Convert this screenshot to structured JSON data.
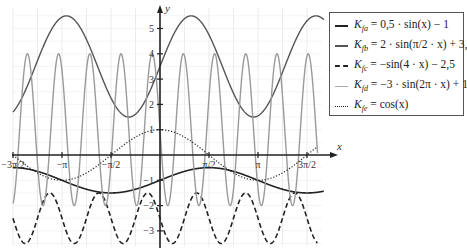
{
  "chart_data": {
    "type": "line",
    "title": "",
    "xlabel": "x",
    "ylabel": "y",
    "xlim": [
      -4.712,
      5.0
    ],
    "ylim": [
      -3.6,
      5.8
    ],
    "grid": true,
    "legend_position": "upper right",
    "x_ticks": [
      {
        "value": -4.712,
        "label": "-3π/2"
      },
      {
        "value": -3.1416,
        "label": "-π"
      },
      {
        "value": -1.5708,
        "label": "-π/2"
      },
      {
        "value": 1.5708,
        "label": "π/2"
      },
      {
        "value": 3.1416,
        "label": "π"
      },
      {
        "value": 4.712,
        "label": "3π/2"
      }
    ],
    "y_ticks": [
      {
        "value": 5,
        "label": "5"
      },
      {
        "value": 4,
        "label": "4"
      },
      {
        "value": 3,
        "label": "3"
      },
      {
        "value": 2,
        "label": "2"
      },
      {
        "value": 1,
        "label": "1"
      },
      {
        "value": -1,
        "label": "-1"
      },
      {
        "value": -2,
        "label": "-2"
      },
      {
        "value": -3,
        "label": "-3"
      }
    ],
    "series": [
      {
        "name": "K_fa = 0,5·sin(x) − 1",
        "id": "fa",
        "amp": 0.5,
        "freq": 1.0,
        "shift": -1.0,
        "style": "solid",
        "color": "#222222",
        "width": 1.6
      },
      {
        "name": "K_fb = 2·sin(π/2·x) + 3,5",
        "id": "fb",
        "amp": 2.0,
        "freq": 1.5708,
        "shift": 3.5,
        "style": "solid",
        "color": "#555555",
        "width": 1.4
      },
      {
        "name": "K_fc = −sin(4·x) − 2,5",
        "id": "fc",
        "amp": -1.0,
        "freq": 4.0,
        "shift": -2.5,
        "style": "dashed",
        "color": "#222222",
        "width": 1.6
      },
      {
        "name": "K_fd = −3·sin(2π·x) + 1",
        "id": "fd",
        "amp": -3.0,
        "freq": 6.2832,
        "shift": 1.0,
        "style": "solid",
        "color": "#9a9a9a",
        "width": 1.4
      },
      {
        "name": "K_fe = cos(x)",
        "id": "fe",
        "amp": 1.0,
        "freq": 1.0,
        "shift": 0.0,
        "phase": 1.5708,
        "style": "dotted",
        "color": "#222222",
        "width": 1.2
      }
    ]
  },
  "legend": {
    "items": [
      {
        "prefix": "K",
        "sub": "fa",
        "formula": " = 0,5 · sin(x) − 1"
      },
      {
        "prefix": "K",
        "sub": "fb",
        "formula": " = 2 · sin(π/2 · x) + 3,5"
      },
      {
        "prefix": "K",
        "sub": "fc",
        "formula": " = −sin(4 · x) − 2,5"
      },
      {
        "prefix": "K",
        "sub": "fd",
        "formula": " = −3 · sin(2π · x) + 1"
      },
      {
        "prefix": "K",
        "sub": "fe",
        "formula": " = cos(x)"
      }
    ]
  },
  "axes": {
    "x_label": "x",
    "y_label": "y"
  }
}
